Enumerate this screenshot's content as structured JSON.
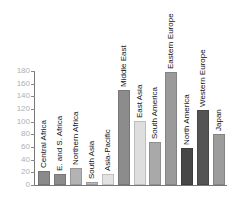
{
  "chart_data": {
    "type": "bar",
    "title": "",
    "xlabel": "",
    "ylabel": "",
    "ylim": [
      0,
      180
    ],
    "yticks": [
      0,
      20,
      40,
      60,
      80,
      100,
      120,
      140,
      160,
      180
    ],
    "grid": false,
    "legend": null,
    "categories": [
      "Central Africa",
      "E. and S. Africa",
      "Northern Africa",
      "South Asia",
      "Asia-Pacific",
      "Middle East",
      "East Asia",
      "South America",
      "Eastern Europe",
      "North America",
      "Western Europe",
      "Japan"
    ],
    "values": [
      22,
      17,
      27,
      5,
      17,
      150,
      101,
      68,
      178,
      58,
      119,
      80
    ],
    "colors": [
      "#8a8a8a",
      "#8c8c8c",
      "#b3b3b3",
      "#b8b8b8",
      "#e2e2e2",
      "#8c8c8c",
      "#dedede",
      "#a9a9a9",
      "#9a9a9a",
      "#474747",
      "#545454",
      "#9c9c9c"
    ],
    "annotations": "Category labels are rotated vertically and placed directly above each bar"
  },
  "axis": {
    "ticks": [
      "0",
      "20",
      "40",
      "60",
      "80",
      "100",
      "120",
      "140",
      "160",
      "180"
    ]
  }
}
